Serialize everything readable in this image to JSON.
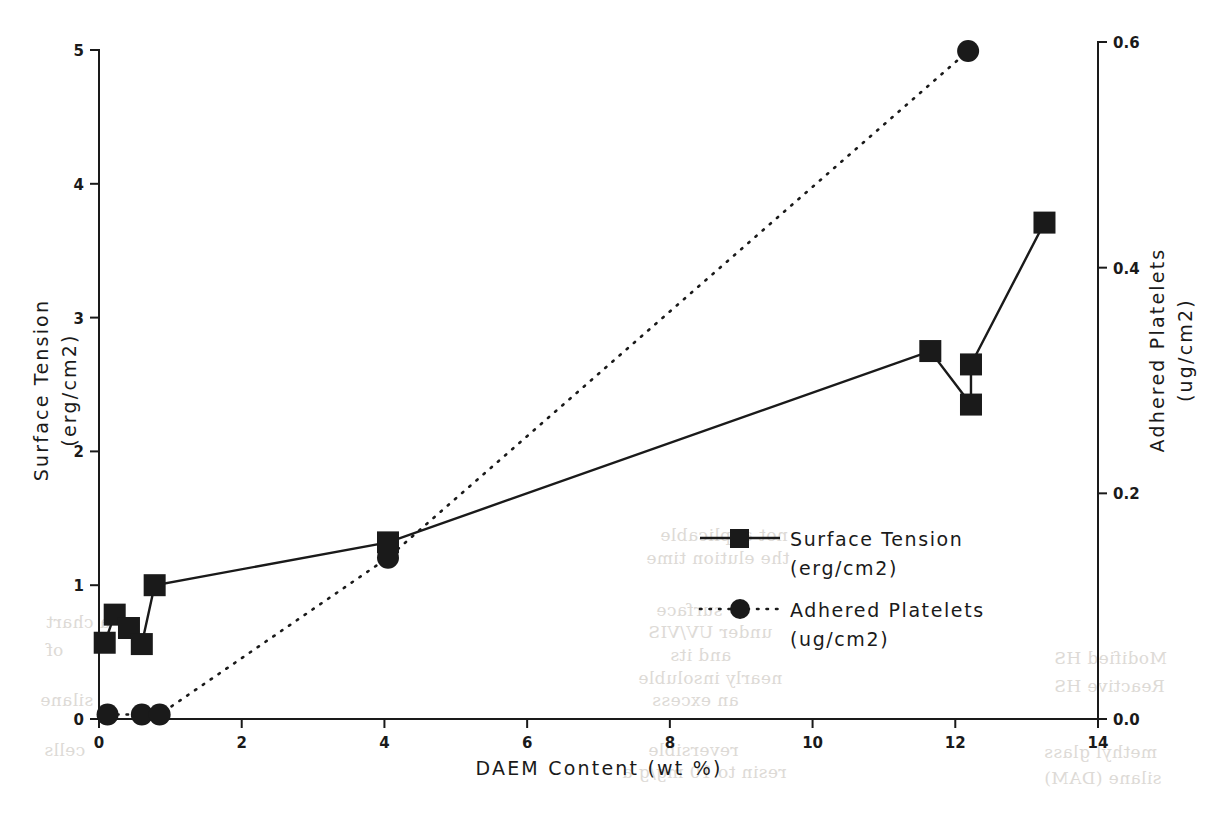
{
  "chart_data": {
    "type": "line",
    "title": "",
    "xlabel": "DAEM Content   (wt %)",
    "ylabel": "Surface Tension\n(erg/cm2)",
    "y2label": "Adhered Platelets\n(ug/cm2)",
    "xlim": [
      0,
      14
    ],
    "ylim": [
      0,
      5
    ],
    "y2lim": [
      0.0,
      0.6
    ],
    "xticks": [
      0,
      2,
      4,
      6,
      8,
      10,
      12,
      14
    ],
    "xticklabels": [
      "0",
      "2",
      "4",
      "6",
      "8",
      "10",
      "12",
      "14"
    ],
    "yticks": [
      0,
      1,
      2,
      3,
      4,
      5
    ],
    "yticklabels": [
      "0",
      "1",
      "2",
      "3",
      "4",
      "5"
    ],
    "y2ticks": [
      0.0,
      0.2,
      0.4,
      0.6
    ],
    "y2ticklabels": [
      "0.0",
      "0.2",
      "0.4",
      "0.6"
    ],
    "grid": false,
    "legend_position": "center-right",
    "series": [
      {
        "name": "Surface Tension",
        "units": "(erg/cm2)",
        "axis": "left",
        "marker": "square",
        "linestyle": "solid",
        "color": "#1a1a1a",
        "x": [
          0.08,
          0.22,
          0.42,
          0.6,
          0.78,
          4.05,
          11.65,
          12.22,
          12.22,
          13.25
        ],
        "y": [
          0.57,
          0.78,
          0.68,
          0.56,
          1.0,
          1.32,
          2.75,
          2.35,
          2.65,
          3.71
        ]
      },
      {
        "name": "Adhered Platelets",
        "units": "(ug/cm2)",
        "axis": "right",
        "marker": "circle",
        "linestyle": "dotted",
        "color": "#1a1a1a",
        "x": [
          0.12,
          0.6,
          0.85,
          4.05,
          12.18
        ],
        "y": [
          0.004,
          0.004,
          0.004,
          0.143,
          0.592
        ]
      }
    ]
  },
  "axes": {
    "x_title": "DAEM Content   (wt %)",
    "y_left_line1": "Surface Tension",
    "y_left_line2": "(erg/cm2)",
    "y_right_line1": "Adhered Platelets",
    "y_right_line2": "(ug/cm2)"
  },
  "legend": {
    "entries": [
      {
        "label": "Surface Tension",
        "sublabel": "(erg/cm2)",
        "marker": "square",
        "linestyle": "solid"
      },
      {
        "label": "Adhered Platelets",
        "sublabel": "(ug/cm2)",
        "marker": "circle",
        "linestyle": "dotted"
      }
    ]
  },
  "ghost_text": [
    {
      "text": "not applicable",
      "x": 660,
      "y": 525
    },
    {
      "text": "the elution time",
      "x": 646,
      "y": 548
    },
    {
      "text": "surface",
      "x": 656,
      "y": 600
    },
    {
      "text": "under UV/VIS",
      "x": 648,
      "y": 622
    },
    {
      "text": "and its",
      "x": 670,
      "y": 645
    },
    {
      "text": "nearly insoluble",
      "x": 638,
      "y": 668
    },
    {
      "text": "an excess",
      "x": 652,
      "y": 690
    },
    {
      "text": "reversible",
      "x": 648,
      "y": 740
    },
    {
      "text": "resin to 10 mg/g a",
      "x": 622,
      "y": 762
    },
    {
      "text": "Modified HS",
      "x": 1054,
      "y": 648
    },
    {
      "text": "Reactive HS",
      "x": 1054,
      "y": 676
    },
    {
      "text": "methyl glass",
      "x": 1044,
      "y": 742
    },
    {
      "text": "silane (DAM)",
      "x": 1044,
      "y": 768
    },
    {
      "text": "a chart",
      "x": 46,
      "y": 612
    },
    {
      "text": "of",
      "x": 46,
      "y": 640
    },
    {
      "text": "silane",
      "x": 40,
      "y": 690
    },
    {
      "text": "cells",
      "x": 44,
      "y": 740
    }
  ],
  "colors": {
    "foreground": "#1a1a1a",
    "background": "#ffffff",
    "ghost": "#d8d4cf"
  }
}
